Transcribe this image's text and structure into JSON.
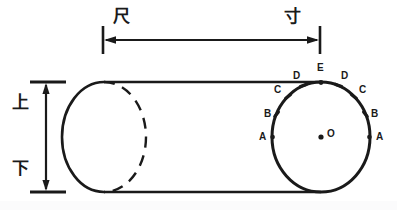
{
  "figure": {
    "type": "technical-line-diagram",
    "background_color": "#ffffff",
    "stroke_color": "#1a1a1a"
  },
  "horizontal_dimension": {
    "left_label": "尺",
    "right_label": "寸",
    "left_extension_x": 103,
    "right_extension_x": 320,
    "line_y": 40,
    "arrowheads": "both"
  },
  "vertical_dimension": {
    "top_label": "上",
    "bottom_label": "下",
    "line_x": 46,
    "top_y": 82,
    "bottom_y": 192,
    "arrowheads": "both"
  },
  "cylinder": {
    "top_edge_y": 82,
    "bottom_edge_y": 192,
    "left_end": {
      "center_x": 104,
      "center_y": 137,
      "rx": 42,
      "ry": 55,
      "near_half": "solid",
      "far_half": "dashed"
    },
    "right_end": {
      "center_x": 321,
      "center_y": 137,
      "rx": 49,
      "ry": 55,
      "style": "solid"
    }
  },
  "circle_points": {
    "center_label": "O",
    "apex_label": "E",
    "left_side": [
      {
        "label": "D",
        "x": 296,
        "y": 76
      },
      {
        "label": "C",
        "x": 277,
        "y": 90
      },
      {
        "label": "B",
        "x": 267,
        "y": 114
      },
      {
        "label": "A",
        "x": 262,
        "y": 140
      }
    ],
    "right_side": [
      {
        "label": "D",
        "x": 344,
        "y": 76
      },
      {
        "label": "C",
        "x": 362,
        "y": 90
      },
      {
        "label": "B",
        "x": 374,
        "y": 114
      },
      {
        "label": "A",
        "x": 379,
        "y": 140
      }
    ]
  }
}
